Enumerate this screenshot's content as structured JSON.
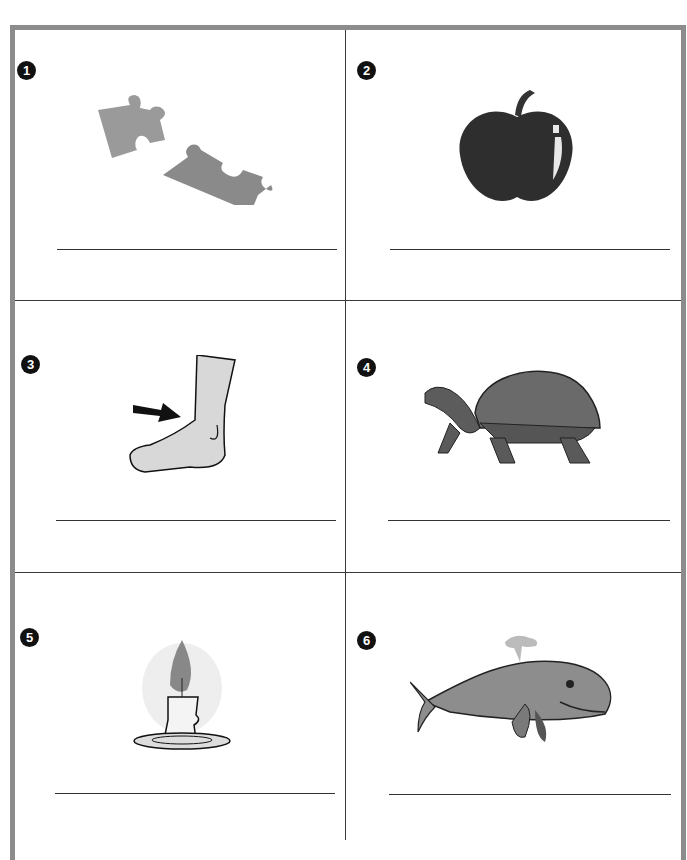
{
  "worksheet": {
    "items": [
      {
        "number": "1",
        "picture": "puzzle-pieces",
        "answer": ""
      },
      {
        "number": "2",
        "picture": "apple",
        "answer": ""
      },
      {
        "number": "3",
        "picture": "foot-with-arrow",
        "answer": ""
      },
      {
        "number": "4",
        "picture": "tortoise",
        "answer": ""
      },
      {
        "number": "5",
        "picture": "candle",
        "answer": ""
      },
      {
        "number": "6",
        "picture": "whale",
        "answer": ""
      }
    ]
  },
  "colors": {
    "frame": "#8c8c8c",
    "divider": "#3a3a3a",
    "badge": "#111111"
  }
}
